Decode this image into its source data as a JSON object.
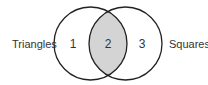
{
  "diagram": {
    "type": "venn",
    "sets": [
      {
        "label": "Triangles",
        "region_label": "1"
      },
      {
        "label": "Squares",
        "region_label": "3"
      }
    ],
    "intersection_label": "2",
    "colors": {
      "stroke": "#222222",
      "intersection_fill": "#d4d4d4",
      "background": "#ffffff"
    }
  }
}
